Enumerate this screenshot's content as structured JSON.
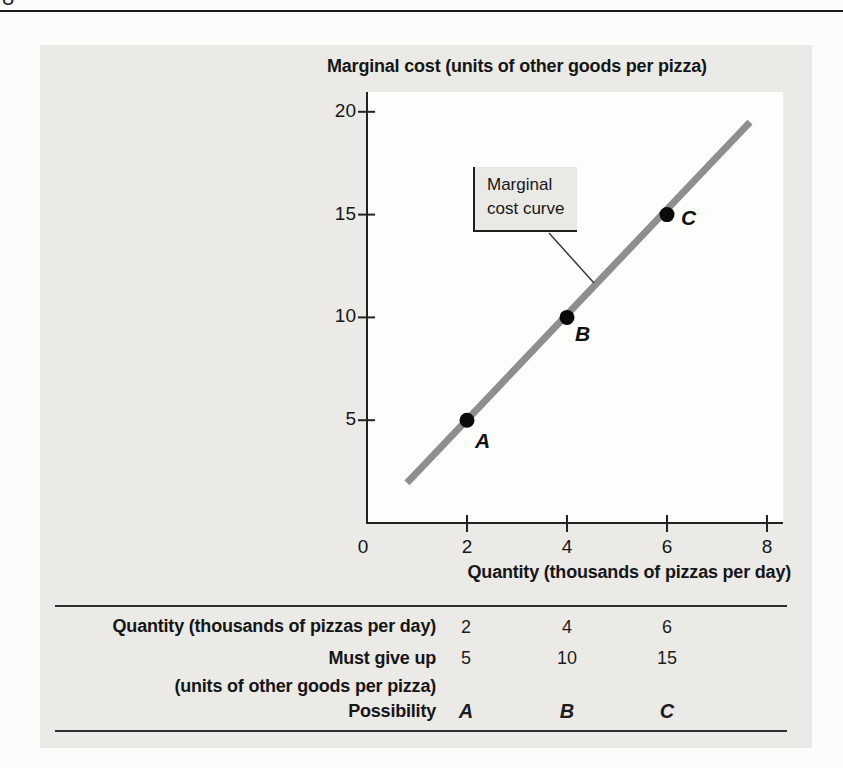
{
  "page": {
    "partial_page_number": "8"
  },
  "figure": {
    "y_axis_title": "Marginal cost (units of other goods per pizza)",
    "x_axis_title": "Quantity (thousands of pizzas per day)",
    "callout_label": "Marginal cost curve"
  },
  "chart_data": {
    "type": "line",
    "title": "",
    "xlabel": "Quantity (thousands of pizzas per day)",
    "ylabel": "Marginal cost (units of other goods per pizza)",
    "xlim": [
      0,
      8.3
    ],
    "ylim": [
      0,
      21
    ],
    "grid": false,
    "x_ticks": [
      0,
      2,
      4,
      6,
      8
    ],
    "y_ticks": [
      5,
      10,
      15,
      20
    ],
    "series": [
      {
        "name": "Marginal cost curve",
        "x": [
          0.8,
          7.66
        ],
        "y": [
          1.95,
          19.5
        ]
      }
    ],
    "points": [
      {
        "label": "A",
        "x": 2,
        "y": 5
      },
      {
        "label": "B",
        "x": 4,
        "y": 10
      },
      {
        "label": "C",
        "x": 6,
        "y": 15
      }
    ],
    "annotation": {
      "text": "Marginal cost curve"
    }
  },
  "table": {
    "rows": [
      {
        "label": "Quantity (thousands of pizzas per day)",
        "values": [
          "2",
          "4",
          "6"
        ]
      },
      {
        "label": "Must give up",
        "label2": "(units of other goods per pizza)",
        "values": [
          "5",
          "10",
          "15"
        ]
      },
      {
        "label": "Possibility",
        "values": [
          "A",
          "B",
          "C"
        ]
      }
    ]
  },
  "colors": {
    "panel": "#ebeae7",
    "plot_background": "#fdfdfc",
    "curve": "#8e8e8e",
    "ink": "#1d1d1d",
    "point": "#0a0a0a"
  }
}
